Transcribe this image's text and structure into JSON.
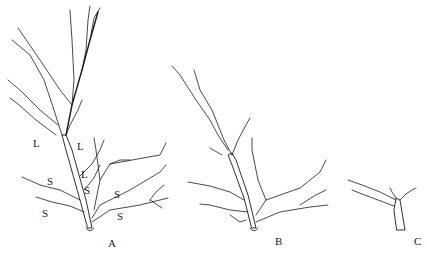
{
  "figure": {
    "panels": [
      {
        "id": "A",
        "label": "A"
      },
      {
        "id": "B",
        "label": "B"
      },
      {
        "id": "C",
        "label": "C"
      }
    ],
    "annotations": [
      {
        "text": "L",
        "x": 33,
        "y": 138
      },
      {
        "text": "L",
        "x": 77,
        "y": 141
      },
      {
        "text": "L",
        "x": 81,
        "y": 169
      },
      {
        "text": "S",
        "x": 47,
        "y": 176
      },
      {
        "text": "S",
        "x": 84,
        "y": 185
      },
      {
        "text": "S",
        "x": 114,
        "y": 189
      },
      {
        "text": "S",
        "x": 42,
        "y": 208
      },
      {
        "text": "S",
        "x": 117,
        "y": 211
      }
    ],
    "colors": {
      "ink": "#1a1a1a",
      "background": "#ffffff"
    }
  }
}
